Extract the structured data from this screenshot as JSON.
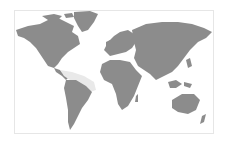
{
  "map": {
    "type": "world-map",
    "land_color": "#8c8c8c",
    "highlight_color": "#e9e9e9",
    "background_color": "#ffffff",
    "border_color": "#e6e6e6",
    "highlighted_region": "Caribbean / northern South America",
    "continents": [
      "North America",
      "Greenland",
      "South America",
      "Europe",
      "Africa",
      "Asia",
      "Australia"
    ]
  }
}
